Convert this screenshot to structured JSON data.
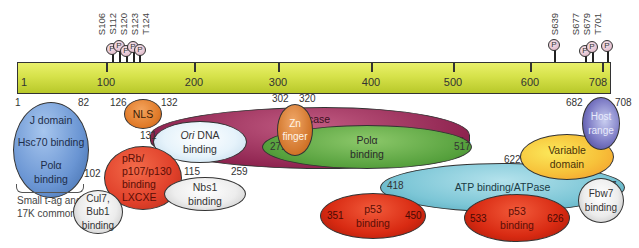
{
  "protein_bar": {
    "start_label": "1",
    "end_label": "708",
    "ticks": [
      "100",
      "200",
      "300",
      "400",
      "500",
      "600"
    ],
    "color": "#d6e24a"
  },
  "phosphosites": [
    "S106",
    "S112",
    "S120",
    "S123",
    "T124",
    "S639",
    "S677",
    "S679",
    "T701"
  ],
  "phospho_symbol": "P",
  "domains": {
    "jdomain": {
      "title": "J domain",
      "line2": "Hsc70 binding",
      "line3a": "Polα",
      "line3b": "binding",
      "start": "1",
      "end": "82",
      "color": "#6f9ad6"
    },
    "nls": {
      "label": "NLS",
      "start": "126",
      "end": "132",
      "color": "#e07a28"
    },
    "prb": {
      "lines": [
        "pRb/",
        "p107/p130",
        "binding",
        "LXCXE"
      ],
      "end": "115",
      "color": "#e2432a"
    },
    "cul7": {
      "line1": "Cul7, Bub1",
      "line2": "binding",
      "start": "102"
    },
    "small_tag_note": {
      "line1": "Small t-ag and",
      "line2": "17K common"
    },
    "ori": {
      "italic": "Ori",
      "rest": " DNA",
      "line2": "binding",
      "start": "131",
      "end": "259",
      "color": "#dcefff"
    },
    "nbs1": {
      "line1": "Nbs1",
      "line2": "binding"
    },
    "helicase": {
      "label": "Helicase",
      "end": "627",
      "color": "#a3355f"
    },
    "zn": {
      "line1": "Zn",
      "line2": "finger",
      "start": "302",
      "end": "320",
      "color": "#d8792e"
    },
    "pola": {
      "line1": "Polα",
      "line2": "binding",
      "start": "271",
      "end": "517",
      "color": "#5ea546"
    },
    "atp": {
      "label": "ATP binding/ATPase",
      "start": "418",
      "end": "627",
      "color": "#7cc6d6"
    },
    "p53a": {
      "line1": "p53",
      "line2": "binding",
      "start": "351",
      "end": "450",
      "color": "#d82a12"
    },
    "p53b": {
      "line1": "p53",
      "line2": "binding",
      "start": "533",
      "end": "626",
      "color": "#d82a12"
    },
    "variable": {
      "line1": "Variable",
      "line2": "domain",
      "start": "622",
      "color": "#f7c23a"
    },
    "host": {
      "line1": "Host",
      "line2": "range",
      "start": "682",
      "end": "708",
      "color": "#5c5aa8"
    },
    "fbw7": {
      "line1": "Fbw7",
      "line2": "binding"
    }
  }
}
